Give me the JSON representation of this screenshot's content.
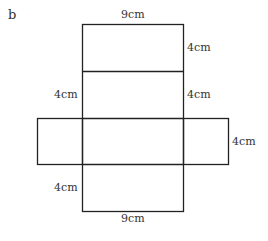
{
  "part_label": "b",
  "labels": {
    "top_width": "9cm",
    "top_right_height": "4cm",
    "mid_left_height": "4cm",
    "mid_right_height": "4cm",
    "side_flap_height": "4cm",
    "bottom_left_height": "4cm",
    "bottom_width": "9cm"
  },
  "colors": {
    "line": "#222222",
    "text": "#333333"
  }
}
